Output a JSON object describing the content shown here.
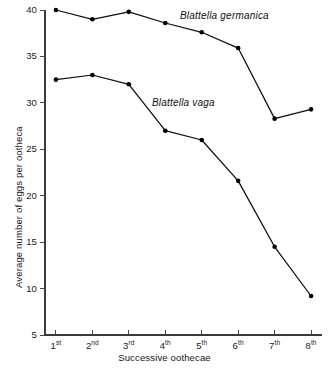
{
  "chart_data": {
    "type": "line",
    "title": "",
    "subtitle": "",
    "xlabel": "Successive oothecae",
    "ylabel": "Average number of eggs per ootheca",
    "categories": [
      "1st",
      "2nd",
      "3rd",
      "4th",
      "5th",
      "6th",
      "7th",
      "8th"
    ],
    "category_parts": [
      {
        "num": "1",
        "ord": "st"
      },
      {
        "num": "2",
        "ord": "nd"
      },
      {
        "num": "3",
        "ord": "rd"
      },
      {
        "num": "4",
        "ord": "th"
      },
      {
        "num": "5",
        "ord": "th"
      },
      {
        "num": "6",
        "ord": "th"
      },
      {
        "num": "7",
        "ord": "th"
      },
      {
        "num": "8",
        "ord": "th"
      }
    ],
    "x": [
      1,
      2,
      3,
      4,
      5,
      6,
      7,
      8
    ],
    "series": [
      {
        "name": "Blattella germanica",
        "values": [
          40.0,
          39.0,
          39.8,
          38.6,
          37.6,
          35.9,
          28.3,
          29.3
        ],
        "color": "#000000",
        "marker": "circle",
        "label_position": "above-right"
      },
      {
        "name": "Blattella vaga",
        "values": [
          32.5,
          33.0,
          32.0,
          27.0,
          26.0,
          21.6,
          14.5,
          9.2
        ],
        "color": "#000000",
        "marker": "circle",
        "label_position": "above-right"
      }
    ],
    "ylim": [
      5,
      40
    ],
    "yticks": [
      5,
      10,
      15,
      20,
      25,
      30,
      35,
      40
    ],
    "ytick_labels": [
      "5",
      "10",
      "15",
      "20",
      "25",
      "30",
      "35",
      "40"
    ],
    "xlim": [
      0.7,
      8.3
    ],
    "grid": false,
    "legend": "inline-annotations",
    "legend_entries": [
      "Blattella germanica",
      "Blattella vaga"
    ],
    "background_color": "#ffffff",
    "axis_color": "#3b3b3b"
  }
}
